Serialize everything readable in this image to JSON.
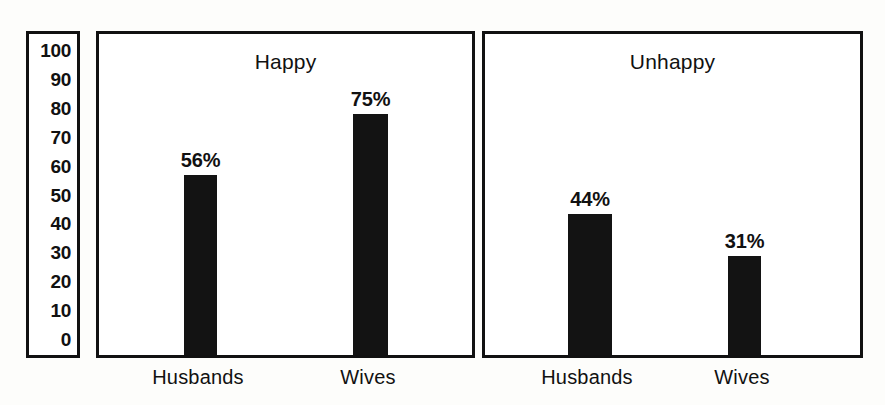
{
  "chart_data": {
    "type": "bar",
    "title": "",
    "xlabel": "",
    "ylabel": "",
    "ylim": [
      0,
      100
    ],
    "grid": false,
    "legend": "none",
    "tick_labels": [
      "100",
      "90",
      "80",
      "70",
      "60",
      "50",
      "40",
      "30",
      "20",
      "10",
      "0"
    ],
    "tick_values": [
      100,
      90,
      80,
      70,
      60,
      50,
      40,
      30,
      20,
      10,
      0
    ],
    "panels": [
      {
        "title": "Happy",
        "categories": [
          "Husbands",
          "Wives"
        ],
        "values": [
          56,
          75
        ],
        "value_labels": [
          "56%",
          "75%"
        ]
      },
      {
        "title": "Unhappy",
        "categories": [
          "Husbands",
          "Wives"
        ],
        "values": [
          44,
          31
        ],
        "value_labels": [
          "44%",
          "31%"
        ]
      }
    ]
  },
  "colors": {
    "bar": "#131313",
    "border": "#111111",
    "text": "#111111",
    "background": "#fdfdfb",
    "panel_background": "#ffffff"
  }
}
